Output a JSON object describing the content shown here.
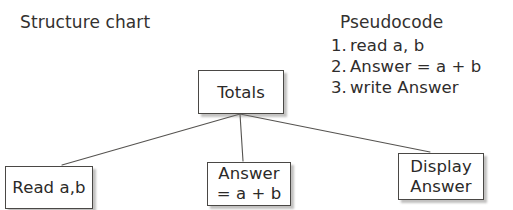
{
  "canvas": {
    "width": 513,
    "height": 210,
    "background": "#ffffff",
    "text_color": "#2f2d2c",
    "box_border_color": "#4a4845",
    "connector_color": "#555350"
  },
  "headings": {
    "structure_chart": "Structure chart",
    "pseudocode": "Pseudocode"
  },
  "pseudocode": {
    "steps": [
      {
        "number": "1.",
        "text": "read a, b"
      },
      {
        "number": "2.",
        "text": "Answer  =  a + b"
      },
      {
        "number": "3.",
        "text": "write Answer"
      }
    ]
  },
  "structure_chart": {
    "root": {
      "id": "totals",
      "label": "Totals"
    },
    "children": [
      {
        "id": "read",
        "line1": "Read a,b",
        "line2": ""
      },
      {
        "id": "answer",
        "line1": "Answer",
        "line2": "= a + b"
      },
      {
        "id": "display",
        "line1": "Display",
        "line2": "Answer"
      }
    ]
  }
}
